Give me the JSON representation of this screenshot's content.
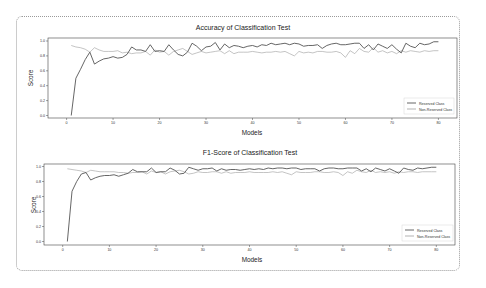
{
  "chart_data": [
    {
      "type": "line",
      "title": "Accuracy of  Classification Test",
      "xlabel": "Models",
      "ylabel": "Score",
      "ylim": [
        0.0,
        1.0
      ],
      "xlim": [
        -4,
        84
      ],
      "xticks": [
        "0",
        "10",
        "20",
        "30",
        "40",
        "50",
        "60",
        "70",
        "80"
      ],
      "yticks": [
        "0.0",
        "0.2",
        "0.4",
        "0.6",
        "0.8",
        "1.0"
      ],
      "legend": {
        "position": "lower right",
        "entries": [
          "Reserved Class",
          "Non-Reserved Class"
        ]
      },
      "grid": false,
      "series": [
        {
          "name": "Reserved Class",
          "color": "#555555",
          "x": [
            1,
            2,
            3,
            4,
            5,
            6,
            7,
            8,
            9,
            10,
            11,
            12,
            13,
            14,
            15,
            16,
            17,
            18,
            19,
            20,
            21,
            22,
            23,
            24,
            25,
            26,
            27,
            28,
            29,
            30,
            31,
            32,
            33,
            34,
            35,
            36,
            37,
            38,
            39,
            40,
            41,
            42,
            43,
            44,
            45,
            46,
            47,
            48,
            49,
            50,
            51,
            52,
            53,
            54,
            55,
            56,
            57,
            58,
            59,
            60,
            61,
            62,
            63,
            64,
            65,
            66,
            67,
            68,
            69,
            70,
            71,
            72,
            73,
            74,
            75,
            76,
            77,
            78,
            79,
            80
          ],
          "values": [
            0.0,
            0.5,
            0.62,
            0.75,
            0.85,
            0.69,
            0.73,
            0.76,
            0.77,
            0.79,
            0.77,
            0.78,
            0.82,
            0.92,
            0.88,
            0.88,
            0.86,
            0.95,
            0.86,
            0.87,
            0.86,
            0.95,
            0.88,
            0.82,
            0.8,
            0.85,
            0.97,
            0.93,
            0.87,
            0.92,
            0.93,
            0.98,
            0.88,
            0.96,
            0.91,
            0.94,
            0.93,
            0.91,
            0.93,
            0.94,
            0.92,
            0.95,
            0.94,
            0.97,
            0.95,
            0.96,
            0.97,
            0.95,
            0.97,
            0.96,
            0.93,
            0.94,
            0.94,
            0.95,
            0.9,
            0.94,
            0.96,
            0.97,
            0.95,
            0.95,
            0.96,
            0.97,
            0.97,
            0.9,
            0.95,
            0.88,
            0.96,
            0.93,
            0.9,
            0.95,
            0.89,
            0.84,
            0.97,
            0.93,
            0.91,
            0.97,
            0.95,
            0.96,
            0.99,
            0.99
          ]
        },
        {
          "name": "Non-Reserved Class",
          "color": "#aaaaaa",
          "x": [
            1,
            2,
            3,
            4,
            5,
            6,
            7,
            8,
            9,
            10,
            11,
            12,
            13,
            14,
            15,
            16,
            17,
            18,
            19,
            20,
            21,
            22,
            23,
            24,
            25,
            26,
            27,
            28,
            29,
            30,
            31,
            32,
            33,
            34,
            35,
            36,
            37,
            38,
            39,
            40,
            41,
            42,
            43,
            44,
            45,
            46,
            47,
            48,
            49,
            50,
            51,
            52,
            53,
            54,
            55,
            56,
            57,
            58,
            59,
            60,
            61,
            62,
            63,
            64,
            65,
            66,
            67,
            68,
            69,
            70,
            71,
            72,
            73,
            74,
            75,
            76,
            77,
            78,
            79,
            80
          ],
          "values": [
            0.94,
            0.92,
            0.91,
            0.89,
            0.85,
            0.91,
            0.88,
            0.86,
            0.86,
            0.86,
            0.87,
            0.84,
            0.85,
            0.83,
            0.84,
            0.84,
            0.86,
            0.81,
            0.88,
            0.85,
            0.86,
            0.81,
            0.86,
            0.88,
            0.9,
            0.86,
            0.82,
            0.84,
            0.86,
            0.84,
            0.85,
            0.86,
            0.87,
            0.83,
            0.87,
            0.83,
            0.85,
            0.85,
            0.85,
            0.86,
            0.85,
            0.84,
            0.85,
            0.85,
            0.86,
            0.85,
            0.86,
            0.83,
            0.8,
            0.86,
            0.84,
            0.85,
            0.84,
            0.86,
            0.86,
            0.85,
            0.85,
            0.86,
            0.84,
            0.78,
            0.87,
            0.83,
            0.9,
            0.86,
            0.85,
            0.91,
            0.85,
            0.87,
            0.84,
            0.86,
            0.83,
            0.87,
            0.85,
            0.87,
            0.86,
            0.85,
            0.87,
            0.86,
            0.87,
            0.87
          ]
        }
      ]
    },
    {
      "type": "line",
      "title": "F1-Score of Classification Test",
      "xlabel": "Models",
      "ylabel": "Score",
      "ylim": [
        0.0,
        1.0
      ],
      "xlim": [
        -4,
        84
      ],
      "xticks": [
        "0",
        "10",
        "20",
        "30",
        "40",
        "50",
        "60",
        "70",
        "80"
      ],
      "yticks": [
        "0.0",
        "0.2",
        "0.4",
        "0.6",
        "0.8",
        "1.0"
      ],
      "legend": {
        "position": "lower right",
        "entries": [
          "Reserved Class",
          "Non-Reserved Class"
        ]
      },
      "grid": false,
      "series": [
        {
          "name": "Reserved Class",
          "color": "#555555",
          "x": [
            1,
            2,
            3,
            4,
            5,
            6,
            7,
            8,
            9,
            10,
            11,
            12,
            13,
            14,
            15,
            16,
            17,
            18,
            19,
            20,
            21,
            22,
            23,
            24,
            25,
            26,
            27,
            28,
            29,
            30,
            31,
            32,
            33,
            34,
            35,
            36,
            37,
            38,
            39,
            40,
            41,
            42,
            43,
            44,
            45,
            46,
            47,
            48,
            49,
            50,
            51,
            52,
            53,
            54,
            55,
            56,
            57,
            58,
            59,
            60,
            61,
            62,
            63,
            64,
            65,
            66,
            67,
            68,
            69,
            70,
            71,
            72,
            73,
            74,
            75,
            76,
            77,
            78,
            79,
            80
          ],
          "values": [
            0.0,
            0.67,
            0.8,
            0.9,
            0.92,
            0.82,
            0.85,
            0.87,
            0.88,
            0.88,
            0.89,
            0.87,
            0.89,
            0.91,
            0.96,
            0.93,
            0.93,
            0.93,
            0.98,
            0.92,
            0.93,
            0.93,
            0.98,
            0.95,
            0.9,
            0.91,
            0.99,
            0.97,
            0.95,
            0.97,
            0.97,
            0.98,
            0.94,
            0.97,
            0.95,
            0.96,
            0.96,
            0.95,
            0.96,
            0.97,
            0.96,
            0.97,
            0.96,
            0.98,
            0.97,
            0.98,
            0.98,
            0.97,
            0.98,
            0.98,
            0.96,
            0.97,
            0.97,
            0.97,
            0.94,
            0.97,
            0.98,
            0.98,
            0.97,
            0.97,
            0.98,
            0.98,
            0.98,
            0.94,
            0.97,
            0.93,
            0.98,
            0.96,
            0.94,
            0.97,
            0.94,
            0.91,
            0.98,
            0.96,
            0.95,
            0.98,
            0.97,
            0.98,
            0.99,
            0.99
          ]
        },
        {
          "name": "Non-Reserved Class",
          "color": "#aaaaaa",
          "x": [
            1,
            2,
            3,
            4,
            5,
            6,
            7,
            8,
            9,
            10,
            11,
            12,
            13,
            14,
            15,
            16,
            17,
            18,
            19,
            20,
            21,
            22,
            23,
            24,
            25,
            26,
            27,
            28,
            29,
            30,
            31,
            32,
            33,
            34,
            35,
            36,
            37,
            38,
            39,
            40,
            41,
            42,
            43,
            44,
            45,
            46,
            47,
            48,
            49,
            50,
            51,
            52,
            53,
            54,
            55,
            56,
            57,
            58,
            59,
            60,
            61,
            62,
            63,
            64,
            65,
            66,
            67,
            68,
            69,
            70,
            71,
            72,
            73,
            74,
            75,
            76,
            77,
            78,
            79,
            80
          ],
          "values": [
            0.97,
            0.96,
            0.95,
            0.94,
            0.92,
            0.95,
            0.94,
            0.93,
            0.93,
            0.93,
            0.93,
            0.92,
            0.92,
            0.91,
            0.92,
            0.92,
            0.93,
            0.9,
            0.94,
            0.92,
            0.93,
            0.9,
            0.93,
            0.94,
            0.95,
            0.93,
            0.9,
            0.91,
            0.93,
            0.92,
            0.92,
            0.93,
            0.93,
            0.91,
            0.93,
            0.91,
            0.92,
            0.92,
            0.92,
            0.93,
            0.92,
            0.92,
            0.92,
            0.92,
            0.93,
            0.92,
            0.93,
            0.91,
            0.89,
            0.93,
            0.92,
            0.92,
            0.92,
            0.93,
            0.93,
            0.92,
            0.92,
            0.93,
            0.92,
            0.88,
            0.93,
            0.91,
            0.95,
            0.93,
            0.92,
            0.95,
            0.92,
            0.93,
            0.92,
            0.93,
            0.91,
            0.93,
            0.92,
            0.93,
            0.93,
            0.92,
            0.93,
            0.93,
            0.93,
            0.93
          ]
        }
      ]
    }
  ]
}
